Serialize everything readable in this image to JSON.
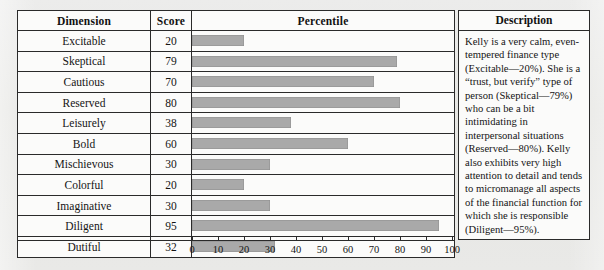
{
  "table": {
    "headers": {
      "dimension": "Dimension",
      "score": "Score",
      "percentile": "Percentile"
    },
    "rows": [
      {
        "dimension": "Excitable",
        "score": "20",
        "value": 20
      },
      {
        "dimension": "Skeptical",
        "score": "79",
        "value": 79
      },
      {
        "dimension": "Cautious",
        "score": "70",
        "value": 70
      },
      {
        "dimension": "Reserved",
        "score": "80",
        "value": 80
      },
      {
        "dimension": "Leisurely",
        "score": "38",
        "value": 38
      },
      {
        "dimension": "Bold",
        "score": "60",
        "value": 60
      },
      {
        "dimension": "Mischievous",
        "score": "30",
        "value": 30
      },
      {
        "dimension": "Colorful",
        "score": "20",
        "value": 20
      },
      {
        "dimension": "Imaginative",
        "score": "30",
        "value": 30
      },
      {
        "dimension": "Diligent",
        "score": "95",
        "value": 95
      },
      {
        "dimension": "Dutiful",
        "score": "32",
        "value": 32
      }
    ]
  },
  "description": {
    "header": "Description",
    "body": "Kelly is a very calm, even-tempered finance type (Excitable—20%). She is a “trust, but verify” type of person (Skeptical—79%) who can be a bit intimidating in interpersonal situations (Reserved—80%). Kelly also exhibits very high attention to detail and tends to micromanage all aspects of the financial function for which she is responsible (Diligent—95%)."
  },
  "axis": {
    "ticks": [
      "0",
      "10",
      "20",
      "30",
      "40",
      "50",
      "60",
      "70",
      "80",
      "90",
      "100"
    ],
    "min": 0,
    "max": 100
  },
  "colors": {
    "bar": "#a9a9a9",
    "border": "#2a2a2a",
    "page_background": "#e9e9e6",
    "cell_background": "#fbfbfa"
  },
  "chart_data": {
    "type": "bar",
    "orientation": "horizontal",
    "title": "Percentile",
    "xlabel": "",
    "ylabel": "",
    "xlim": [
      0,
      100
    ],
    "grid": false,
    "legend": null,
    "categories": [
      "Excitable",
      "Skeptical",
      "Cautious",
      "Reserved",
      "Leisurely",
      "Bold",
      "Mischievous",
      "Colorful",
      "Imaginative",
      "Diligent",
      "Dutiful"
    ],
    "values": [
      20,
      79,
      70,
      80,
      38,
      60,
      30,
      20,
      30,
      95,
      32
    ],
    "tick_labels": [
      "0",
      "10",
      "20",
      "30",
      "40",
      "50",
      "60",
      "70",
      "80",
      "90",
      "100"
    ],
    "bar_color": "#a9a9a9"
  }
}
